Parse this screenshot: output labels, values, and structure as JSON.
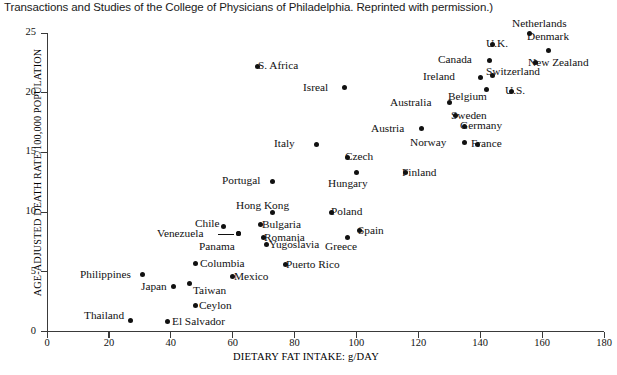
{
  "caption": "Transactions and Studies of the College of Physicians of Philadelphia. Reprinted with permission.)",
  "chart_data": {
    "type": "scatter",
    "title": "",
    "xlabel": "DIETARY FAT INTAKE: g/DAY",
    "ylabel": "AGE-ADJUSTED DEATH RATE/100,000 POPULATION",
    "xlim": [
      0,
      180
    ],
    "ylim": [
      0,
      25
    ],
    "xticks": [
      0,
      20,
      40,
      60,
      80,
      100,
      120,
      140,
      160,
      180
    ],
    "yticks": [
      0,
      5,
      10,
      15,
      20,
      25
    ],
    "grid": false,
    "legend": "none",
    "points": [
      {
        "name": "Netherlands",
        "x": 156,
        "y": 25.0,
        "lx": 512,
        "ly": 18,
        "anchor": "center"
      },
      {
        "name": "U.K.",
        "x": 144,
        "y": 24.0,
        "lx": 486,
        "ly": 38,
        "anchor": "left"
      },
      {
        "name": "Denmark",
        "x": 162,
        "y": 23.5,
        "lx": 527,
        "ly": 31,
        "anchor": "center"
      },
      {
        "name": "Canada",
        "x": 143,
        "y": 22.7,
        "lx": 438,
        "ly": 54,
        "anchor": "left"
      },
      {
        "name": "New Zealand",
        "x": 158,
        "y": 22.5,
        "lx": 528,
        "ly": 57,
        "anchor": "left"
      },
      {
        "name": "S. Africa",
        "x": 68,
        "y": 22.2,
        "lx": 258,
        "ly": 60,
        "anchor": "left"
      },
      {
        "name": "Ireland",
        "x": 140,
        "y": 21.3,
        "lx": 423,
        "ly": 71,
        "anchor": "left"
      },
      {
        "name": "Switzerland",
        "x": 144,
        "y": 21.4,
        "lx": 486,
        "ly": 66,
        "anchor": "left"
      },
      {
        "name": "Isreal",
        "x": 96,
        "y": 20.4,
        "lx": 303,
        "ly": 82,
        "anchor": "left"
      },
      {
        "name": "Belgium",
        "x": 142,
        "y": 20.3,
        "lx": 448,
        "ly": 91,
        "anchor": "left"
      },
      {
        "name": "U.S.",
        "x": 150,
        "y": 20.1,
        "lx": 505,
        "ly": 85,
        "anchor": "left"
      },
      {
        "name": "Australia",
        "x": 130,
        "y": 19.2,
        "lx": 390,
        "ly": 97,
        "anchor": "left"
      },
      {
        "name": "Sweden",
        "x": 132,
        "y": 18.1,
        "lx": 451,
        "ly": 110,
        "anchor": "left"
      },
      {
        "name": "Germany",
        "x": 135,
        "y": 17.2,
        "lx": 460,
        "ly": 120,
        "anchor": "left"
      },
      {
        "name": "Austria",
        "x": 121,
        "y": 17.0,
        "lx": 371,
        "ly": 123,
        "anchor": "left"
      },
      {
        "name": "Norway",
        "x": 135,
        "y": 15.8,
        "lx": 410,
        "ly": 137,
        "anchor": "left"
      },
      {
        "name": "France",
        "x": 139,
        "y": 15.7,
        "lx": 471,
        "ly": 138,
        "anchor": "left"
      },
      {
        "name": "Italy",
        "x": 87,
        "y": 15.7,
        "lx": 274,
        "ly": 138,
        "anchor": "left"
      },
      {
        "name": "Czech",
        "x": 97,
        "y": 14.6,
        "lx": 345,
        "ly": 151,
        "anchor": "left"
      },
      {
        "name": "Finland",
        "x": 116,
        "y": 13.3,
        "lx": 402,
        "ly": 167,
        "anchor": "left"
      },
      {
        "name": "Hungary",
        "x": 100,
        "y": 13.3,
        "lx": 328,
        "ly": 178,
        "anchor": "left"
      },
      {
        "name": "Portugal",
        "x": 73,
        "y": 12.6,
        "lx": 222,
        "ly": 175,
        "anchor": "left"
      },
      {
        "name": "Poland",
        "x": 92,
        "y": 10.0,
        "lx": 331,
        "ly": 206,
        "anchor": "left"
      },
      {
        "name": "Hong Kong",
        "x": 73,
        "y": 10.0,
        "lx": 236,
        "ly": 200,
        "anchor": "left"
      },
      {
        "name": "Chile",
        "x": 57,
        "y": 8.8,
        "lx": 195,
        "ly": 218,
        "anchor": "left"
      },
      {
        "name": "Bulgaria",
        "x": 69,
        "y": 9.0,
        "lx": 262,
        "ly": 219,
        "anchor": "left"
      },
      {
        "name": "Spain",
        "x": 101,
        "y": 8.5,
        "lx": 358,
        "ly": 225,
        "anchor": "left"
      },
      {
        "name": "Venezuela",
        "x": 62,
        "y": 8.2,
        "lx": 157,
        "ly": 228,
        "anchor": "left"
      },
      {
        "name": "Romania",
        "x": 70,
        "y": 7.9,
        "lx": 264,
        "ly": 232,
        "anchor": "left"
      },
      {
        "name": "Greece",
        "x": 97,
        "y": 7.9,
        "lx": 325,
        "ly": 241,
        "anchor": "left"
      },
      {
        "name": "Panama",
        "x": 62,
        "y": 8.2,
        "lx": 199,
        "ly": 241,
        "anchor": "left"
      },
      {
        "name": "Yugoslavia",
        "x": 71,
        "y": 7.3,
        "lx": 269,
        "ly": 239,
        "anchor": "left"
      },
      {
        "name": "Columbia",
        "x": 48,
        "y": 5.7,
        "lx": 200,
        "ly": 258,
        "anchor": "left"
      },
      {
        "name": "Puerto Rico",
        "x": 77,
        "y": 5.6,
        "lx": 286,
        "ly": 259,
        "anchor": "left"
      },
      {
        "name": "Philippines",
        "x": 31,
        "y": 4.8,
        "lx": 80,
        "ly": 269,
        "anchor": "left"
      },
      {
        "name": "Mexico",
        "x": 60,
        "y": 4.6,
        "lx": 234,
        "ly": 271,
        "anchor": "left"
      },
      {
        "name": "Taiwan",
        "x": 46,
        "y": 4.0,
        "lx": 193,
        "ly": 285,
        "anchor": "left"
      },
      {
        "name": "Japan",
        "x": 41,
        "y": 3.8,
        "lx": 141,
        "ly": 281,
        "anchor": "left"
      },
      {
        "name": "Ceylon",
        "x": 48,
        "y": 2.2,
        "lx": 199,
        "ly": 300,
        "anchor": "left"
      },
      {
        "name": "Thailand",
        "x": 27,
        "y": 0.9,
        "lx": 84,
        "ly": 310,
        "anchor": "left"
      },
      {
        "name": "El Salvador",
        "x": 39,
        "y": 0.8,
        "lx": 172,
        "ly": 316,
        "anchor": "left"
      }
    ]
  }
}
